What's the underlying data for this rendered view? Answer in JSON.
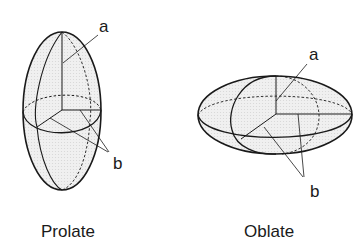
{
  "figure": {
    "prolate": {
      "caption": "Prolate",
      "axis_a_label": "a",
      "axis_b_label": "b"
    },
    "oblate": {
      "caption": "Oblate",
      "axis_a_label": "a",
      "axis_b_label": "b"
    },
    "colors": {
      "stroke": "#1a1a1a",
      "fill": "#ececec",
      "background": "#ffffff"
    }
  }
}
